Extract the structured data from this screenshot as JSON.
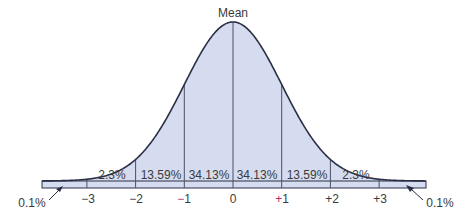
{
  "chart_data": {
    "type": "area",
    "title": "",
    "annotation_top": "Mean",
    "xlabel": "",
    "ylabel": "",
    "distribution": "normal",
    "x_ticks": [
      "−3",
      "−2",
      "−1",
      "0",
      "+1",
      "+2",
      "+3"
    ],
    "x_tick_values": [
      -3,
      -2,
      -1,
      0,
      1,
      2,
      3
    ],
    "regions": [
      {
        "from": "-inf",
        "to": -3,
        "label": "0.1%",
        "value": 0.1
      },
      {
        "from": -3,
        "to": -2,
        "label": "2.3%",
        "value": 2.3
      },
      {
        "from": -2,
        "to": -1,
        "label": "13.59%",
        "value": 13.59
      },
      {
        "from": -1,
        "to": 0,
        "label": "34.13%",
        "value": 34.13
      },
      {
        "from": 0,
        "to": 1,
        "label": "34.13%",
        "value": 34.13
      },
      {
        "from": 1,
        "to": 2,
        "label": "13.59%",
        "value": 13.59
      },
      {
        "from": 2,
        "to": 3,
        "label": "2.3%",
        "value": 2.3
      },
      {
        "from": 3,
        "to": "inf",
        "label": "0.1%",
        "value": 0.1
      }
    ],
    "tail_labels": {
      "left": "0.1%",
      "right": "0.1%"
    },
    "grid": false,
    "legend": null
  },
  "colors": {
    "fill": "#d6dcef",
    "curve": "#2a2f45",
    "divider": "#4a4f63",
    "text": "#3a3a3a",
    "sign_accent": "#b0306a"
  },
  "labels": {
    "mean": "Mean",
    "left_tail": "0.1%",
    "right_tail": "0.1%",
    "pct": [
      "2.3%",
      "13.59%",
      "34.13%",
      "34.13%",
      "13.59%",
      "2.3%"
    ],
    "ticks": {
      "m3": "−3",
      "m2": "−2",
      "m1_sign": "−",
      "m1_num": "1",
      "zero": "0",
      "p1_sign": "+",
      "p1_num": "1",
      "p2": "+2",
      "p3": "+3"
    }
  }
}
